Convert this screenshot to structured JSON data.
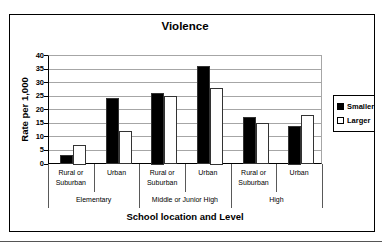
{
  "chart_data": {
    "type": "bar",
    "title": "Violence",
    "xlabel": "School location and Level",
    "ylabel": "Rate per 1,000",
    "ylim": [
      0,
      40
    ],
    "ytick_interval": 5,
    "ytick_labels": [
      "0",
      "5",
      "10",
      "15",
      "20",
      "25",
      "30",
      "35",
      "40"
    ],
    "grid": true,
    "legend_position": "right",
    "categories": [
      "Rural or Suburban",
      "Urban",
      "Rural or Suburban",
      "Urban",
      "Rural or Suburban",
      "Urban"
    ],
    "level_groups": [
      {
        "label": "Elementary",
        "span": 2
      },
      {
        "label": "Middle or Junior High",
        "span": 2
      },
      {
        "label": "High",
        "span": 2
      }
    ],
    "series": [
      {
        "name": "Smaller",
        "fill": "#000000",
        "values": [
          3,
          24,
          26,
          36,
          17,
          14
        ]
      },
      {
        "name": "Larger",
        "fill": "#ffffff",
        "values": [
          7,
          12,
          25,
          28,
          15,
          18
        ]
      }
    ],
    "colors": {
      "grid": "#a6a6a6",
      "axis": "#000000",
      "bar_border": "#333333",
      "separator": "#595959"
    }
  }
}
